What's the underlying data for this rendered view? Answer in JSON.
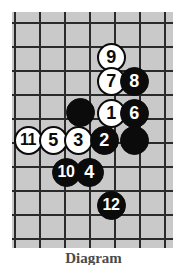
{
  "figure": {
    "kind": "go-board-diagram",
    "caption": "Diagram",
    "board": {
      "background_color": "#c9c9c9",
      "line_color": "#2a2a2a",
      "vertical_line_x": [
        2,
        27,
        52,
        77,
        102,
        127,
        152
      ],
      "horizontal_line_y": [
        10,
        34,
        58,
        82,
        106,
        130,
        154,
        178,
        202,
        226
      ],
      "grid_spacing_x": 25,
      "grid_spacing_y": 24
    },
    "stone_colors": {
      "black": "#0b0b0b",
      "white": "#ffffff",
      "black_label": "#ffffff",
      "white_label": "#0b0b0b"
    },
    "stones": [
      {
        "label": "9",
        "color": "white",
        "cx": 111,
        "cy": 57
      },
      {
        "label": "7",
        "color": "white",
        "cx": 111,
        "cy": 81
      },
      {
        "label": "8",
        "color": "black",
        "cx": 134,
        "cy": 81
      },
      {
        "label": "",
        "color": "black",
        "cx": 80,
        "cy": 112
      },
      {
        "label": "1",
        "color": "white",
        "cx": 111,
        "cy": 113
      },
      {
        "label": "6",
        "color": "black",
        "cx": 134,
        "cy": 113
      },
      {
        "label": "11",
        "color": "white",
        "cx": 28,
        "cy": 140
      },
      {
        "label": "5",
        "color": "white",
        "cx": 53,
        "cy": 140
      },
      {
        "label": "3",
        "color": "white",
        "cx": 78,
        "cy": 140
      },
      {
        "label": "2",
        "color": "black",
        "cx": 104,
        "cy": 140
      },
      {
        "label": "",
        "color": "black",
        "cx": 134,
        "cy": 140
      },
      {
        "label": "10",
        "color": "black",
        "cx": 66,
        "cy": 172
      },
      {
        "label": "4",
        "color": "black",
        "cx": 89,
        "cy": 172
      },
      {
        "label": "12",
        "color": "black",
        "cx": 111,
        "cy": 205
      }
    ]
  }
}
